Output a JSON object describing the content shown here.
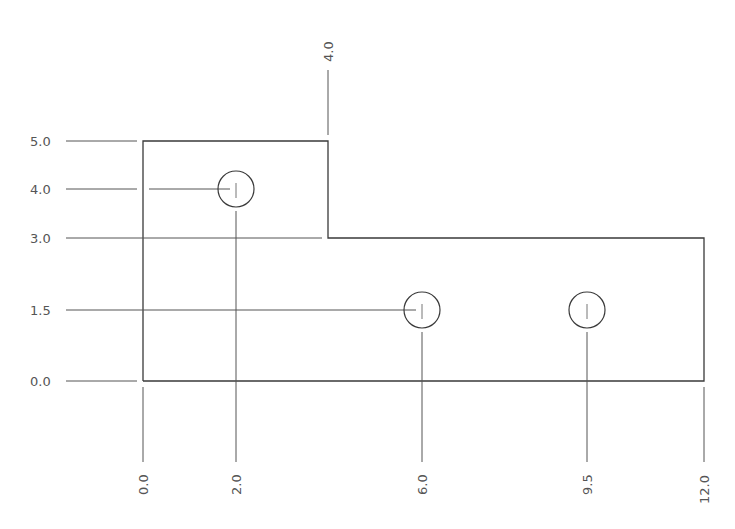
{
  "drawing": {
    "type": "ordinate dimensioned plate",
    "y_dims": [
      {
        "label": "5.0",
        "value": 5.0
      },
      {
        "label": "4.0",
        "value": 4.0
      },
      {
        "label": "3.0",
        "value": 3.0
      },
      {
        "label": "1.5",
        "value": 1.5
      },
      {
        "label": "0.0",
        "value": 0.0
      }
    ],
    "x_dims": [
      {
        "label": "0.0",
        "value": 0.0
      },
      {
        "label": "2.0",
        "value": 2.0
      },
      {
        "label": "6.0",
        "value": 6.0
      },
      {
        "label": "9.5",
        "value": 9.5
      },
      {
        "label": "12.0",
        "value": 12.0
      }
    ],
    "top_dim": {
      "label": "4.0",
      "value": 4.0
    },
    "holes": [
      {
        "x": 2.0,
        "y": 4.0
      },
      {
        "x": 6.0,
        "y": 1.5
      },
      {
        "x": 9.5,
        "y": 1.5
      }
    ],
    "outline": [
      [
        0,
        0
      ],
      [
        0,
        5
      ],
      [
        4,
        5
      ],
      [
        4,
        3
      ],
      [
        12,
        3
      ],
      [
        12,
        0
      ]
    ],
    "line_color": "#3a3a3a"
  }
}
